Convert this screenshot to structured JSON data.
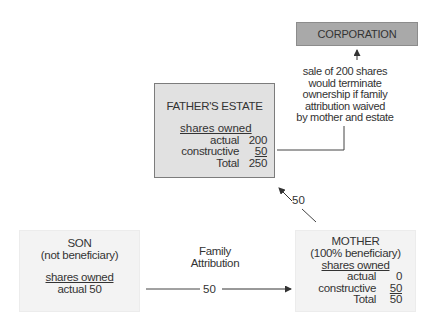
{
  "corporation": {
    "label": "CORPORATION"
  },
  "note": {
    "lines": [
      "sale of 200 shares",
      "would terminate",
      "ownership if family",
      "attribution waived",
      "by mother and estate"
    ]
  },
  "fathers_estate": {
    "title": "FATHER'S ESTATE",
    "shares_heading": "shares owned",
    "rows": [
      {
        "label": "actual",
        "value": "200"
      },
      {
        "label": "constructive",
        "value": "50"
      },
      {
        "label": "Total",
        "value": "250"
      }
    ]
  },
  "son": {
    "title": "SON",
    "subtitle": "(not beneficiary)",
    "shares_heading": "shares owned",
    "actual": "actual 50"
  },
  "mother": {
    "title": "MOTHER",
    "subtitle": "(100% beneficiary)",
    "shares_heading": "shares owned",
    "rows": [
      {
        "label": "actual",
        "value": "0"
      },
      {
        "label": "constructive",
        "value": "50"
      },
      {
        "label": "Total",
        "value": "50"
      }
    ]
  },
  "edges": {
    "family_attribution_label_1": "Family",
    "family_attribution_label_2": "Attribution",
    "son_to_mother_value": "50",
    "mother_to_estate_value": "50"
  }
}
